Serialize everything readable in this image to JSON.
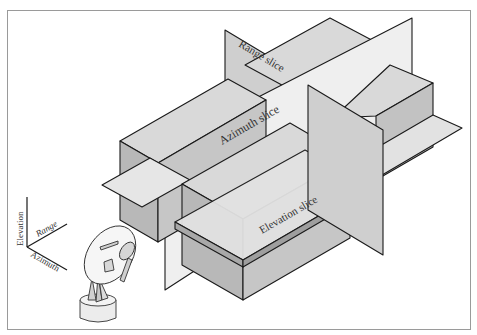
{
  "diagram": {
    "labels": {
      "range_slice": "Range slice",
      "azimuth_slice": "Azimuth slice",
      "elevation_slice": "Elevation slice"
    },
    "axes": {
      "elevation": "Elevation",
      "range": "Range",
      "azimuth": "Azimuth"
    },
    "objects": [
      "data-volume-blocks",
      "range-slice-plane",
      "azimuth-slice-plane",
      "elevation-slice-plane",
      "radar-dish"
    ],
    "colors": {
      "top_face": "#d9d9d9",
      "left_face": "#b8b8b8",
      "right_face": "#c6c6c6",
      "range_plane": "#cfcfcf",
      "azimuth_plane": "#efefef",
      "elevation_plane": "#e2e2e2",
      "edge": "#1a1a1a",
      "frame_border": "#9a9a9a"
    }
  }
}
